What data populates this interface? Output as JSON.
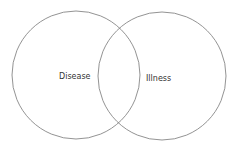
{
  "diagram": {
    "type": "venn",
    "sets": [
      {
        "label": "Disease",
        "cx": 76,
        "cy": 75,
        "r": 64
      },
      {
        "label": "Illness",
        "cx": 162,
        "cy": 76,
        "r": 64
      }
    ],
    "stroke_color": "#777777"
  }
}
